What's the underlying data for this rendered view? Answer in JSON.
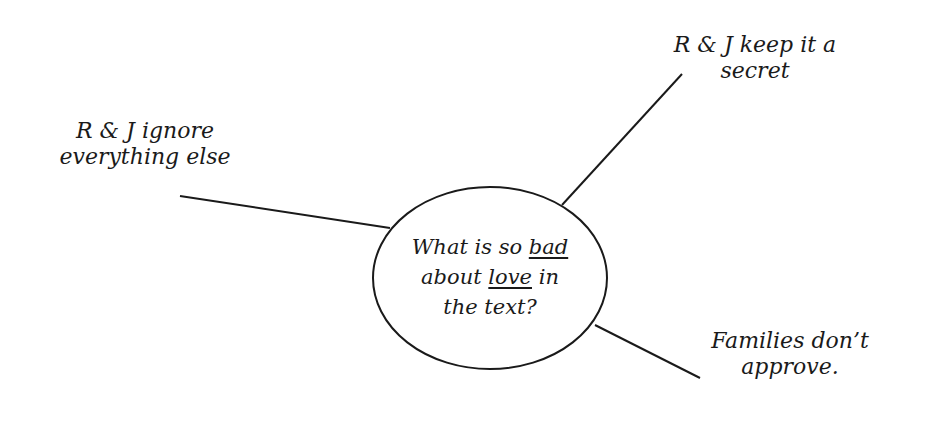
{
  "diagram": {
    "type": "mind-map",
    "central": {
      "line1_pre": "What is so ",
      "line1_u": "bad",
      "line2_pre": "about ",
      "line2_u": "love",
      "line2_post": " in",
      "line3": "the text?"
    },
    "branches": [
      {
        "line1": "R & J ignore",
        "line2": "everything else"
      },
      {
        "line1": "R & J keep it a",
        "line2": "secret"
      },
      {
        "line1": "Families don’t",
        "line2": "approve."
      }
    ],
    "colors": {
      "ink": "#1a1a1a",
      "background": "#ffffff"
    }
  }
}
